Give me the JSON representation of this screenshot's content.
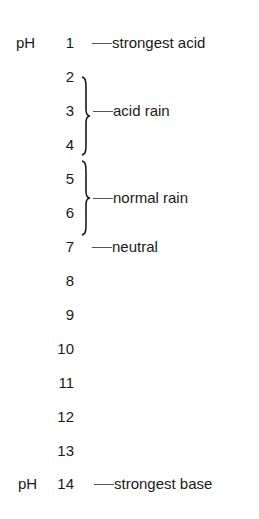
{
  "scale": {
    "prefix": "pH",
    "levels": [
      {
        "value": "1",
        "show_prefix": true,
        "label": "strongest acid"
      },
      {
        "value": "2",
        "show_prefix": false,
        "label": ""
      },
      {
        "value": "3",
        "show_prefix": false,
        "label": ""
      },
      {
        "value": "4",
        "show_prefix": false,
        "label": ""
      },
      {
        "value": "5",
        "show_prefix": false,
        "label": ""
      },
      {
        "value": "6",
        "show_prefix": false,
        "label": ""
      },
      {
        "value": "7",
        "show_prefix": false,
        "label": "neutral"
      },
      {
        "value": "8",
        "show_prefix": false,
        "label": ""
      },
      {
        "value": "9",
        "show_prefix": false,
        "label": ""
      },
      {
        "value": "10",
        "show_prefix": false,
        "label": ""
      },
      {
        "value": "11",
        "show_prefix": false,
        "label": ""
      },
      {
        "value": "12",
        "show_prefix": false,
        "label": ""
      },
      {
        "value": "13",
        "show_prefix": false,
        "label": ""
      },
      {
        "value": "14",
        "show_prefix": true,
        "label": "strongest base"
      }
    ],
    "ranges": [
      {
        "from": "2",
        "to": "4",
        "label": "acid rain"
      },
      {
        "from": "5",
        "to": "6",
        "label": "normal rain"
      }
    ]
  },
  "colors": {
    "text": "#1a1a1a",
    "dash": "#555555",
    "background": "#ffffff"
  }
}
